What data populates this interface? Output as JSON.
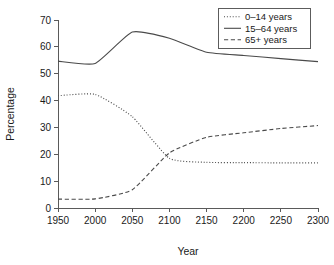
{
  "chart_data": {
    "type": "line",
    "title": "",
    "xlabel": "Year",
    "ylabel": "Percentage",
    "x": [
      1950,
      2000,
      2050,
      2100,
      2150,
      2200,
      2250,
      2300
    ],
    "xlim": [
      1950,
      2300
    ],
    "ylim": [
      0,
      70
    ],
    "xticks": [
      "1950",
      "2000",
      "2050",
      "2100",
      "2150",
      "2200",
      "2250",
      "2300"
    ],
    "yticks": [
      "0",
      "10",
      "20",
      "30",
      "40",
      "50",
      "60",
      "70"
    ],
    "grid": false,
    "legend_position": "top-right",
    "series": [
      {
        "name": "0–14 years",
        "style": "dotted",
        "values": [
          41.8,
          42.3,
          34.0,
          18.5,
          17.0,
          16.9,
          16.8,
          16.8
        ]
      },
      {
        "name": "15–64 years",
        "style": "solid",
        "values": [
          54.7,
          53.8,
          65.5,
          63.2,
          58.0,
          56.8,
          55.6,
          54.5
        ]
      },
      {
        "name": "65+ years",
        "style": "dashed",
        "values": [
          3.3,
          3.4,
          6.8,
          20.5,
          26.3,
          28.0,
          29.6,
          30.7
        ]
      }
    ]
  },
  "axes": {
    "x_title": "Year",
    "y_title": "Percentage"
  },
  "legend": {
    "entries": [
      {
        "label": "0–14 years",
        "style": "dotted"
      },
      {
        "label": "15–64 years",
        "style": "solid"
      },
      {
        "label": "65+ years",
        "style": "dashed"
      }
    ]
  },
  "colors": {
    "line": "#4a4a4a",
    "axis": "#5a5a5a",
    "text": "#1a1a1a",
    "background": "#ffffff"
  }
}
